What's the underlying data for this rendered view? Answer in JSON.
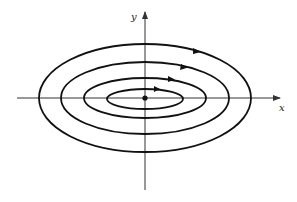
{
  "diagram": {
    "type": "phase-portrait",
    "axes": {
      "x_label": "x",
      "y_label": "y"
    },
    "origin_point": "equilibrium-center",
    "orbits": [
      {
        "name": "orbit-1",
        "rx": 37,
        "ry": 10,
        "direction": "clockwise"
      },
      {
        "name": "orbit-2",
        "rx": 62,
        "ry": 19,
        "direction": "clockwise"
      },
      {
        "name": "orbit-3",
        "rx": 85,
        "ry": 28,
        "direction": "clockwise"
      },
      {
        "name": "orbit-4",
        "rx": 106,
        "ry": 54,
        "direction": "clockwise"
      }
    ],
    "colors": {
      "stroke": "#111111",
      "axis": "#333333",
      "background": "#ffffff"
    }
  }
}
